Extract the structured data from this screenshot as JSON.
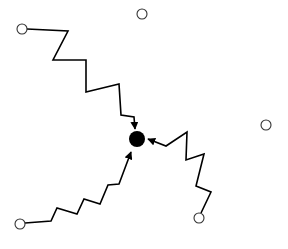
{
  "diagram": {
    "colors": {
      "background": "#ffffff",
      "stroke": "#000000",
      "center_fill": "#000000",
      "node_fill": "#ffffff"
    },
    "center_node": {
      "x": 137,
      "y": 139,
      "r": 8
    },
    "outer_nodes": [
      {
        "id": "top-left",
        "x": 22,
        "y": 29,
        "r": 5,
        "connected": true
      },
      {
        "id": "top",
        "x": 142,
        "y": 14,
        "r": 5,
        "connected": false
      },
      {
        "id": "right",
        "x": 266,
        "y": 125,
        "r": 5,
        "connected": false
      },
      {
        "id": "bottom-right",
        "x": 199,
        "y": 218,
        "r": 5,
        "connected": true
      },
      {
        "id": "bottom-left",
        "x": 20,
        "y": 224,
        "r": 5,
        "connected": true
      }
    ],
    "paths": [
      {
        "id": "path-top-left",
        "from": "top-left",
        "points": "27,29 68,31 53,60 86,60 86,92 119,84 121,115 134,117 135,129"
      },
      {
        "id": "path-bottom-right",
        "from": "bottom-right",
        "points": "201,213 211,192 196,186 204,154 186,160 187,132 166,146 148,139"
      },
      {
        "id": "path-bottom-left",
        "from": "bottom-left",
        "points": "25,223 51,221 57,208 77,214 84,199 100,204 108,185 119,184 131,152"
      }
    ]
  }
}
